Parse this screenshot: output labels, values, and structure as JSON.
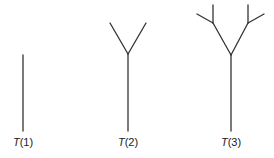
{
  "diagram": {
    "stroke_color": "#333333",
    "trees": [
      {
        "name": "T(1)",
        "label_var": "T",
        "label_arg": "(1)"
      },
      {
        "name": "T(2)",
        "label_var": "T",
        "label_arg": "(2)"
      },
      {
        "name": "T(3)",
        "label_var": "T",
        "label_arg": "(3)"
      }
    ]
  }
}
